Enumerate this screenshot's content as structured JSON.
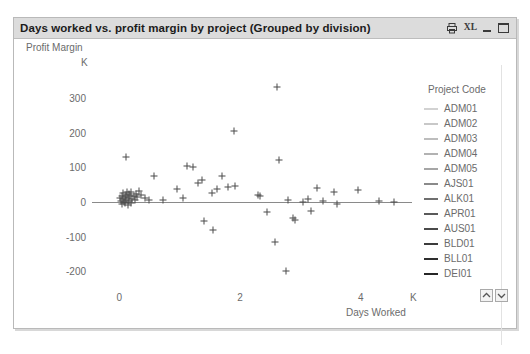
{
  "window": {
    "title": "Days worked vs. profit margin by project (Grouped by division)",
    "controls": [
      {
        "name": "print-icon",
        "label": "Print"
      },
      {
        "name": "excel-export-icon",
        "label": "XL"
      },
      {
        "name": "minimize-icon",
        "label": "Minimize"
      },
      {
        "name": "maximize-icon",
        "label": "Maximize"
      }
    ]
  },
  "legend": {
    "title": "Project Code",
    "items": [
      {
        "label": "ADM01",
        "color": "#d2d2d2"
      },
      {
        "label": "ADM02",
        "color": "#c8c8c8"
      },
      {
        "label": "ADM03",
        "color": "#bdbdbd"
      },
      {
        "label": "ADM04",
        "color": "#b2b2b2"
      },
      {
        "label": "ADM05",
        "color": "#a6a6a6"
      },
      {
        "label": "AJS01",
        "color": "#8a8a8a"
      },
      {
        "label": "ALK01",
        "color": "#6f6f6f"
      },
      {
        "label": "APR01",
        "color": "#5a5a5a"
      },
      {
        "label": "AUS01",
        "color": "#4a4a4a"
      },
      {
        "label": "BLD01",
        "color": "#3c3c3c"
      },
      {
        "label": "BLL01",
        "color": "#2e2e2e"
      },
      {
        "label": "DEI01",
        "color": "#262626"
      }
    ],
    "scroll_up_label": "Scroll legend up",
    "scroll_down_label": "Scroll legend down"
  },
  "chart_data": {
    "type": "scatter",
    "title": "Days worked vs. profit margin by project (Grouped by division)",
    "xlabel": "Days Worked",
    "ylabel": "Profit Margin",
    "xunit": "K",
    "yunit": "K",
    "xlim": [
      -0.45,
      4.85
    ],
    "ylim": [
      -245,
      360
    ],
    "xticks": [
      0,
      2,
      4
    ],
    "yticks": [
      300,
      200,
      100,
      0,
      -100,
      -200
    ],
    "grid": false,
    "legend_position": "right",
    "zero_line": 0,
    "marker": "plus",
    "marker_color": "#4a4a4a",
    "points": [
      {
        "x": 0.02,
        "y": 10
      },
      {
        "x": 0.03,
        "y": 2
      },
      {
        "x": 0.04,
        "y": 18
      },
      {
        "x": 0.05,
        "y": -5
      },
      {
        "x": 0.06,
        "y": 8
      },
      {
        "x": 0.07,
        "y": 25
      },
      {
        "x": 0.08,
        "y": 0
      },
      {
        "x": 0.09,
        "y": 14
      },
      {
        "x": 0.1,
        "y": -3
      },
      {
        "x": 0.11,
        "y": 20
      },
      {
        "x": 0.12,
        "y": 6
      },
      {
        "x": 0.13,
        "y": 30
      },
      {
        "x": 0.14,
        "y": -8
      },
      {
        "x": 0.15,
        "y": 12
      },
      {
        "x": 0.16,
        "y": 4
      },
      {
        "x": 0.17,
        "y": 22
      },
      {
        "x": 0.18,
        "y": 16
      },
      {
        "x": 0.19,
        "y": -2
      },
      {
        "x": 0.2,
        "y": 28
      },
      {
        "x": 0.22,
        "y": 9
      },
      {
        "x": 0.24,
        "y": 18
      },
      {
        "x": 0.26,
        "y": 5
      },
      {
        "x": 0.28,
        "y": 24
      },
      {
        "x": 0.3,
        "y": 13
      },
      {
        "x": 0.33,
        "y": 32
      },
      {
        "x": 0.36,
        "y": 20
      },
      {
        "x": 0.12,
        "y": 130
      },
      {
        "x": 0.42,
        "y": 10
      },
      {
        "x": 0.5,
        "y": 6
      },
      {
        "x": 0.58,
        "y": 75
      },
      {
        "x": 0.72,
        "y": 5
      },
      {
        "x": 0.95,
        "y": 38
      },
      {
        "x": 1.06,
        "y": 12
      },
      {
        "x": 1.12,
        "y": 105
      },
      {
        "x": 1.22,
        "y": 100
      },
      {
        "x": 1.3,
        "y": 55
      },
      {
        "x": 1.38,
        "y": 62
      },
      {
        "x": 1.54,
        "y": 25
      },
      {
        "x": 1.62,
        "y": 38
      },
      {
        "x": 1.7,
        "y": 75
      },
      {
        "x": 1.8,
        "y": 44
      },
      {
        "x": 1.92,
        "y": 45
      },
      {
        "x": 1.4,
        "y": -55
      },
      {
        "x": 1.55,
        "y": -82
      },
      {
        "x": 1.9,
        "y": 205
      },
      {
        "x": 2.3,
        "y": 20
      },
      {
        "x": 2.34,
        "y": 18
      },
      {
        "x": 2.45,
        "y": -30
      },
      {
        "x": 2.58,
        "y": -115
      },
      {
        "x": 2.62,
        "y": 330
      },
      {
        "x": 2.65,
        "y": 120
      },
      {
        "x": 2.8,
        "y": 5
      },
      {
        "x": 2.88,
        "y": -45
      },
      {
        "x": 2.92,
        "y": -52
      },
      {
        "x": 2.76,
        "y": -200
      },
      {
        "x": 3.05,
        "y": 0
      },
      {
        "x": 3.12,
        "y": 8
      },
      {
        "x": 3.18,
        "y": -25
      },
      {
        "x": 3.28,
        "y": 40
      },
      {
        "x": 3.38,
        "y": 2
      },
      {
        "x": 3.55,
        "y": 30
      },
      {
        "x": 3.6,
        "y": -5
      },
      {
        "x": 3.95,
        "y": 35
      },
      {
        "x": 4.55,
        "y": 0
      },
      {
        "x": 4.3,
        "y": 2
      }
    ]
  }
}
